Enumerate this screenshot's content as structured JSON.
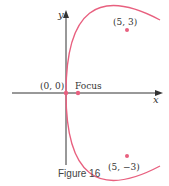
{
  "figure": {
    "caption": "Figure 16",
    "x_axis_label": "x",
    "y_axis_label": "y",
    "curve_color": "#e8607f",
    "axis_color": "#333333",
    "points": [
      {
        "label": "(0, 0)",
        "x": 0,
        "y": 0
      },
      {
        "label": "Focus",
        "x": 0.45,
        "y": 0
      },
      {
        "label": "(5, 3)",
        "x": 5,
        "y": 3
      },
      {
        "label": "(5, −3)",
        "x": 5,
        "y": -3
      }
    ],
    "equation": "y^2 = (9/5)x"
  }
}
